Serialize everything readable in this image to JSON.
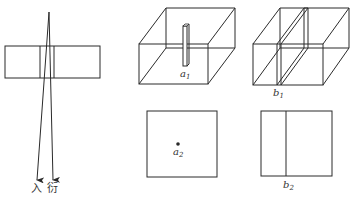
{
  "figure": {
    "left_panel": {
      "description": "Plate with beam passing through; incident and diffracted rays",
      "labels": {
        "incident": "入",
        "diffracted": "衍"
      }
    },
    "top_panels": [
      {
        "id": "a1",
        "label_main": "a",
        "label_sub": "1",
        "description": "Cube with thin vertical rod inclusion"
      },
      {
        "id": "b1",
        "label_main": "b",
        "label_sub": "1",
        "description": "Cube with thin planar slab inclusion"
      }
    ],
    "bottom_panels": [
      {
        "id": "a2",
        "label_main": "a",
        "label_sub": "2",
        "description": "Square projection with point"
      },
      {
        "id": "b2",
        "label_main": "b",
        "label_sub": "2",
        "description": "Square projection with line"
      }
    ],
    "colors": {
      "line": "#2a2a2a",
      "background": "#ffffff"
    }
  }
}
